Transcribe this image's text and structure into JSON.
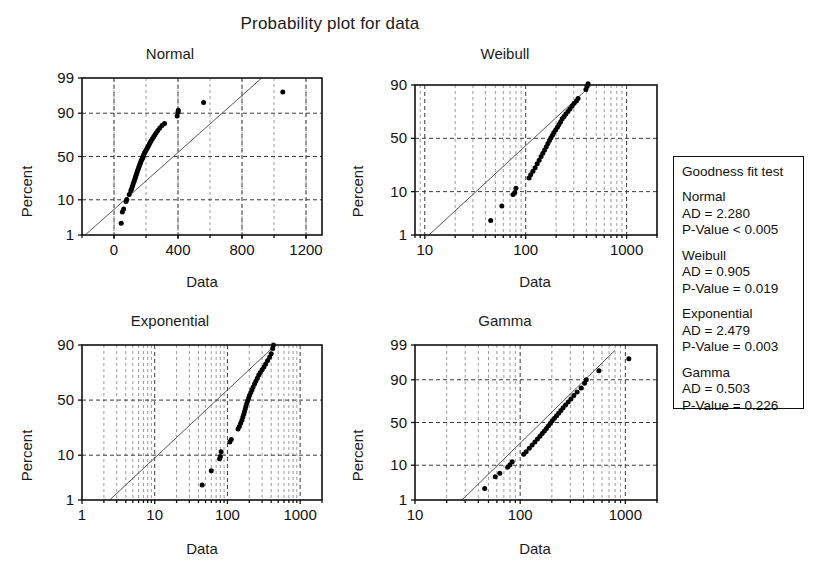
{
  "title": "Probability plot for data",
  "axis_titles": {
    "x": "Data",
    "y": "Percent"
  },
  "legend": {
    "heading": "Goodness fit test",
    "entries": [
      {
        "name": "Normal",
        "ad_label": "AD = 2.280",
        "p_label": "P-Value < 0.005"
      },
      {
        "name": "Weibull",
        "ad_label": "AD = 0.905",
        "p_label": "P-Value = 0.019"
      },
      {
        "name": "Exponential",
        "ad_label": "AD = 2.479",
        "p_label": "P-Value = 0.003"
      },
      {
        "name": "Gamma",
        "ad_label": "AD = 0.503",
        "p_label": "P-Value = 0.226"
      }
    ]
  },
  "chart_data": [
    {
      "type": "scatter",
      "title": "Normal",
      "xlabel": "Data",
      "ylabel": "Percent",
      "xscale": "linear",
      "yscale": "probability",
      "xlim": [
        -200,
        1300
      ],
      "xticks": [
        0,
        400,
        800,
        1200
      ],
      "yticks": [
        1,
        10,
        50,
        90,
        99
      ],
      "grid": true,
      "fit_line": {
        "x": [
          -180,
          1000
        ],
        "y": [
          1.0,
          99.6
        ]
      },
      "points": [
        {
          "x": 45,
          "y": 2.4
        },
        {
          "x": 52,
          "y": 5.0
        },
        {
          "x": 60,
          "y": 6.0
        },
        {
          "x": 75,
          "y": 9.2
        },
        {
          "x": 80,
          "y": 10.2
        },
        {
          "x": 95,
          "y": 13.0
        },
        {
          "x": 105,
          "y": 15.5
        },
        {
          "x": 110,
          "y": 17.0
        },
        {
          "x": 115,
          "y": 19.0
        },
        {
          "x": 120,
          "y": 21.0
        },
        {
          "x": 125,
          "y": 23.0
        },
        {
          "x": 130,
          "y": 25.0
        },
        {
          "x": 134,
          "y": 27.0
        },
        {
          "x": 138,
          "y": 29.0
        },
        {
          "x": 142,
          "y": 31.0
        },
        {
          "x": 146,
          "y": 33.0
        },
        {
          "x": 150,
          "y": 35.0
        },
        {
          "x": 154,
          "y": 37.0
        },
        {
          "x": 158,
          "y": 39.0
        },
        {
          "x": 162,
          "y": 41.0
        },
        {
          "x": 166,
          "y": 43.0
        },
        {
          "x": 170,
          "y": 45.0
        },
        {
          "x": 174,
          "y": 46.5
        },
        {
          "x": 178,
          "y": 48.0
        },
        {
          "x": 182,
          "y": 50.0
        },
        {
          "x": 186,
          "y": 52.0
        },
        {
          "x": 190,
          "y": 54.0
        },
        {
          "x": 196,
          "y": 56.0
        },
        {
          "x": 202,
          "y": 58.0
        },
        {
          "x": 208,
          "y": 60.0
        },
        {
          "x": 214,
          "y": 62.0
        },
        {
          "x": 220,
          "y": 64.0
        },
        {
          "x": 226,
          "y": 66.0
        },
        {
          "x": 232,
          "y": 68.0
        },
        {
          "x": 240,
          "y": 70.0
        },
        {
          "x": 248,
          "y": 72.0
        },
        {
          "x": 256,
          "y": 74.0
        },
        {
          "x": 264,
          "y": 76.0
        },
        {
          "x": 274,
          "y": 78.0
        },
        {
          "x": 286,
          "y": 80.0
        },
        {
          "x": 300,
          "y": 82.0
        },
        {
          "x": 316,
          "y": 83.5
        },
        {
          "x": 395,
          "y": 88.5
        },
        {
          "x": 400,
          "y": 90.5
        },
        {
          "x": 402,
          "y": 91.5
        },
        {
          "x": 560,
          "y": 94.5
        },
        {
          "x": 1055,
          "y": 97.2
        }
      ]
    },
    {
      "type": "scatter",
      "title": "Weibull",
      "xlabel": "Data",
      "ylabel": "Percent",
      "xscale": "log",
      "yscale": "weibull",
      "xlim": [
        8,
        2000
      ],
      "xticks": [
        10,
        100,
        1000
      ],
      "yticks": [
        1,
        10,
        50,
        90
      ],
      "grid": true,
      "fit_line": {
        "x": [
          11,
          900
        ],
        "y": [
          1.0,
          97.5
        ]
      },
      "points": [
        {
          "x": 45,
          "y": 2.4
        },
        {
          "x": 58,
          "y": 5.2
        },
        {
          "x": 75,
          "y": 8.8
        },
        {
          "x": 78,
          "y": 9.6
        },
        {
          "x": 80,
          "y": 11.5
        },
        {
          "x": 108,
          "y": 17.0
        },
        {
          "x": 112,
          "y": 19.0
        },
        {
          "x": 118,
          "y": 21.5
        },
        {
          "x": 124,
          "y": 24.0
        },
        {
          "x": 130,
          "y": 27.0
        },
        {
          "x": 136,
          "y": 30.0
        },
        {
          "x": 142,
          "y": 33.0
        },
        {
          "x": 148,
          "y": 36.0
        },
        {
          "x": 154,
          "y": 39.0
        },
        {
          "x": 160,
          "y": 42.0
        },
        {
          "x": 166,
          "y": 45.0
        },
        {
          "x": 172,
          "y": 48.0
        },
        {
          "x": 178,
          "y": 50.5
        },
        {
          "x": 184,
          "y": 53.0
        },
        {
          "x": 190,
          "y": 55.5
        },
        {
          "x": 198,
          "y": 58.0
        },
        {
          "x": 206,
          "y": 60.5
        },
        {
          "x": 214,
          "y": 63.0
        },
        {
          "x": 222,
          "y": 65.5
        },
        {
          "x": 230,
          "y": 68.0
        },
        {
          "x": 240,
          "y": 70.0
        },
        {
          "x": 250,
          "y": 72.0
        },
        {
          "x": 262,
          "y": 74.0
        },
        {
          "x": 274,
          "y": 76.0
        },
        {
          "x": 288,
          "y": 78.0
        },
        {
          "x": 302,
          "y": 80.0
        },
        {
          "x": 318,
          "y": 81.5
        },
        {
          "x": 330,
          "y": 83.0
        },
        {
          "x": 395,
          "y": 88.0
        },
        {
          "x": 405,
          "y": 89.5
        },
        {
          "x": 415,
          "y": 90.5
        },
        {
          "x": 560,
          "y": 93.5
        },
        {
          "x": 1050,
          "y": 96.5
        }
      ]
    },
    {
      "type": "scatter",
      "title": "Exponential",
      "xlabel": "Data",
      "ylabel": "Percent",
      "xscale": "log",
      "yscale": "exponential",
      "xlim": [
        1,
        2000
      ],
      "xticks": [
        1,
        10,
        100,
        1000
      ],
      "yticks": [
        1,
        10,
        50,
        90
      ],
      "grid": true,
      "fit_line": {
        "x": [
          2.4,
          1100
        ],
        "y": [
          1.0,
          97.0
        ]
      },
      "points": [
        {
          "x": 45,
          "y": 2.4
        },
        {
          "x": 60,
          "y": 5.0
        },
        {
          "x": 78,
          "y": 8.6
        },
        {
          "x": 80,
          "y": 9.5
        },
        {
          "x": 82,
          "y": 11.5
        },
        {
          "x": 108,
          "y": 16.5
        },
        {
          "x": 113,
          "y": 18.0
        },
        {
          "x": 140,
          "y": 25.0
        },
        {
          "x": 146,
          "y": 27.0
        },
        {
          "x": 152,
          "y": 29.5
        },
        {
          "x": 158,
          "y": 32.0
        },
        {
          "x": 163,
          "y": 34.5
        },
        {
          "x": 168,
          "y": 37.0
        },
        {
          "x": 172,
          "y": 39.5
        },
        {
          "x": 176,
          "y": 42.0
        },
        {
          "x": 180,
          "y": 44.5
        },
        {
          "x": 185,
          "y": 47.0
        },
        {
          "x": 190,
          "y": 49.5
        },
        {
          "x": 196,
          "y": 52.0
        },
        {
          "x": 202,
          "y": 54.5
        },
        {
          "x": 210,
          "y": 57.0
        },
        {
          "x": 218,
          "y": 59.5
        },
        {
          "x": 226,
          "y": 62.0
        },
        {
          "x": 236,
          "y": 64.5
        },
        {
          "x": 246,
          "y": 67.0
        },
        {
          "x": 258,
          "y": 69.5
        },
        {
          "x": 270,
          "y": 72.0
        },
        {
          "x": 284,
          "y": 74.0
        },
        {
          "x": 300,
          "y": 76.0
        },
        {
          "x": 318,
          "y": 78.0
        },
        {
          "x": 336,
          "y": 80.0
        },
        {
          "x": 356,
          "y": 82.0
        },
        {
          "x": 380,
          "y": 84.0
        },
        {
          "x": 400,
          "y": 86.0
        },
        {
          "x": 420,
          "y": 88.5
        },
        {
          "x": 430,
          "y": 90.0
        },
        {
          "x": 600,
          "y": 93.5
        },
        {
          "x": 1000,
          "y": 96.0
        },
        {
          "x": 1080,
          "y": 97.0
        }
      ]
    },
    {
      "type": "scatter",
      "title": "Gamma",
      "xlabel": "Data",
      "ylabel": "Percent",
      "xscale": "log",
      "yscale": "gamma",
      "xlim": [
        10,
        2000
      ],
      "xticks": [
        10,
        100,
        1000
      ],
      "yticks": [
        1,
        10,
        50,
        90,
        99
      ],
      "grid": true,
      "fit_line": {
        "x": [
          28,
          800
        ],
        "y": [
          1.0,
          98.5
        ]
      },
      "points": [
        {
          "x": 46,
          "y": 2.4
        },
        {
          "x": 58,
          "y": 5.2
        },
        {
          "x": 64,
          "y": 6.4
        },
        {
          "x": 76,
          "y": 9.0
        },
        {
          "x": 80,
          "y": 10.3
        },
        {
          "x": 84,
          "y": 12.0
        },
        {
          "x": 108,
          "y": 17.0
        },
        {
          "x": 114,
          "y": 19.0
        },
        {
          "x": 122,
          "y": 22.0
        },
        {
          "x": 130,
          "y": 25.0
        },
        {
          "x": 138,
          "y": 28.0
        },
        {
          "x": 146,
          "y": 31.0
        },
        {
          "x": 154,
          "y": 34.0
        },
        {
          "x": 162,
          "y": 37.0
        },
        {
          "x": 170,
          "y": 40.0
        },
        {
          "x": 178,
          "y": 43.0
        },
        {
          "x": 186,
          "y": 46.0
        },
        {
          "x": 194,
          "y": 49.0
        },
        {
          "x": 202,
          "y": 52.0
        },
        {
          "x": 212,
          "y": 55.0
        },
        {
          "x": 222,
          "y": 58.0
        },
        {
          "x": 232,
          "y": 61.0
        },
        {
          "x": 244,
          "y": 64.0
        },
        {
          "x": 256,
          "y": 67.0
        },
        {
          "x": 270,
          "y": 70.0
        },
        {
          "x": 286,
          "y": 73.0
        },
        {
          "x": 304,
          "y": 76.0
        },
        {
          "x": 324,
          "y": 79.0
        },
        {
          "x": 348,
          "y": 82.0
        },
        {
          "x": 380,
          "y": 85.0
        },
        {
          "x": 410,
          "y": 88.0
        },
        {
          "x": 425,
          "y": 90.0
        },
        {
          "x": 560,
          "y": 94.0
        },
        {
          "x": 1080,
          "y": 97.2
        }
      ]
    }
  ]
}
